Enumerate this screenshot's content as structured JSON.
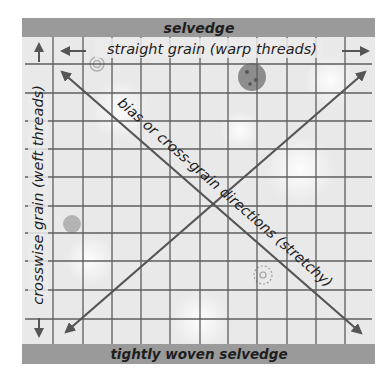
{
  "diagram": {
    "title_top_bar": "selvedge",
    "title_bottom_bar": "tightly woven selvedge",
    "straight_grain_label": "straight grain (warp threads)",
    "crosswise_label": "crosswise grain (weft threads)",
    "bias_label": "bias or cross-grain directions (stretchy)",
    "colors": {
      "bar": "#9a9a9a",
      "fabric": "#e9e9e9",
      "grid_line": "#5a5a5a",
      "arrow": "#555555",
      "text": "#1e1e1e"
    },
    "grid": {
      "vertical_lines_x": [
        53,
        83,
        112,
        141,
        170,
        200,
        228,
        257,
        287,
        316,
        345
      ],
      "horizontal_lines_y": [
        64,
        93,
        121,
        149,
        177,
        206,
        233,
        261,
        290,
        319
      ]
    },
    "decorations": [
      "spiral-motif",
      "ladybug-motif",
      "dot-motif",
      "flower-motif"
    ]
  }
}
